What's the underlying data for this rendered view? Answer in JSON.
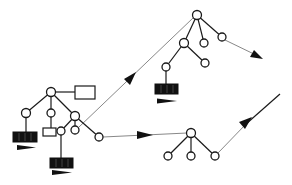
{
  "diagram": {
    "title": "",
    "colors": {
      "line": "#1a1a1a",
      "connector": "#888888",
      "node_fill": "#ffffff",
      "block_fill": "#111111",
      "background": "#ffffff"
    },
    "trees": [
      {
        "id": "left-tree",
        "nodes": [
          {
            "id": "A",
            "x": 51,
            "y": 92
          },
          {
            "id": "B",
            "x": 26,
            "y": 113
          },
          {
            "id": "C",
            "x": 51,
            "y": 113
          },
          {
            "id": "D",
            "x": 75,
            "y": 116
          },
          {
            "id": "E",
            "x": 61,
            "y": 131
          },
          {
            "id": "F",
            "x": 75,
            "y": 130
          },
          {
            "id": "G",
            "x": 99,
            "y": 137
          }
        ],
        "white_rects": [
          {
            "id": "A-rect",
            "x": 75,
            "y": 86,
            "w": 20,
            "h": 13,
            "attached_to": "A"
          },
          {
            "id": "C-rect",
            "x": 43,
            "y": 128,
            "w": 13,
            "h": 8,
            "attached_to": "C"
          }
        ],
        "black_blocks": [
          {
            "id": "B-block",
            "x": 13,
            "y": 132,
            "w": 24,
            "h": 10,
            "attached_to": "B"
          },
          {
            "id": "E-block",
            "x": 50,
            "y": 158,
            "w": 23,
            "h": 10,
            "attached_to": "E"
          }
        ],
        "pointer_arrows": [
          {
            "id": "B-arrow",
            "x1": 17,
            "x2": 36,
            "y": 147
          },
          {
            "id": "E-arrow",
            "x1": 52,
            "x2": 72,
            "y": 172
          }
        ]
      },
      {
        "id": "top-right-tree",
        "nodes": [
          {
            "id": "R",
            "x": 197,
            "y": 15
          },
          {
            "id": "H",
            "x": 184,
            "y": 43
          },
          {
            "id": "I",
            "x": 204,
            "y": 43
          },
          {
            "id": "J",
            "x": 222,
            "y": 37
          },
          {
            "id": "K",
            "x": 166,
            "y": 67
          },
          {
            "id": "L",
            "x": 205,
            "y": 63
          }
        ],
        "black_blocks": [
          {
            "id": "K-block",
            "x": 155,
            "y": 84,
            "w": 23,
            "h": 10,
            "attached_to": "K"
          }
        ],
        "pointer_arrows": [
          {
            "id": "K-arrow",
            "x1": 157,
            "x2": 177,
            "y": 101
          }
        ]
      },
      {
        "id": "bottom-right-tree",
        "nodes": [
          {
            "id": "S",
            "x": 191,
            "y": 133
          },
          {
            "id": "T1",
            "x": 168,
            "y": 156
          },
          {
            "id": "T2",
            "x": 191,
            "y": 156
          },
          {
            "id": "T3",
            "x": 215,
            "y": 156
          }
        ]
      }
    ],
    "connectors": [
      {
        "id": "F-to-R",
        "from": "F",
        "to": "R",
        "x1": 79,
        "y1": 127,
        "x2": 193,
        "y2": 18,
        "arrow_at": [
          128,
          80
        ],
        "style": "gray"
      },
      {
        "id": "G-to-S",
        "from": "G",
        "to": "S",
        "x1": 103,
        "y1": 137,
        "x2": 187,
        "y2": 133,
        "arrow_at": [
          145,
          135
        ],
        "style": "gray"
      },
      {
        "id": "J-out",
        "from": "J",
        "x1": 225,
        "y1": 40,
        "x2": 262,
        "y2": 58,
        "arrow_at": [
          262,
          58
        ],
        "style": "gray"
      },
      {
        "id": "T3-out",
        "from": "T3",
        "x1": 218,
        "y1": 153,
        "x2": 280,
        "y2": 95,
        "arrow_at": [
          246,
          124
        ],
        "style": "gray"
      }
    ]
  }
}
